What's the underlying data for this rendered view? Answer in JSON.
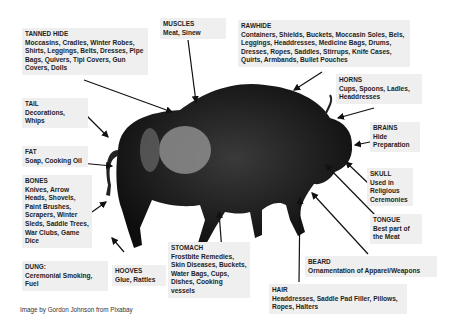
{
  "credit": "Image by Gordon Johnson from Pixabay",
  "colors": {
    "label_bg": "#efefef",
    "text": "#1e1e1e",
    "arrow": "#111111",
    "animal": "#1a1a1a"
  },
  "labels": [
    {
      "id": "tanned-hide",
      "title": "TANNED HIDE",
      "body": "Moccasins, Cradles, Winter Robes, Shirts, Leggings, Belts, Dresses, Pipe Bags, Quivers, Tipi Covers, Gun Covers, Dolls"
    },
    {
      "id": "muscles",
      "title": "MUSCLES",
      "body": "Meat, Sinew"
    },
    {
      "id": "rawhide",
      "title": "RAWHIDE",
      "body": "Containers, Shields, Buckets, Moccasin Soles, Bels, Leggings, Headdresses, Medicine Bags, Drums, Dresses, Ropes, Saddles, Stirrups, Knife Cases, Quirts, Armbands, Bullet Pouches"
    },
    {
      "id": "horns",
      "title": "HORNS",
      "body": "Cups, Spoons, Ladles, Headdresses"
    },
    {
      "id": "brains",
      "title": "BRAINS",
      "body": "Hide Preparation"
    },
    {
      "id": "skull",
      "title": "SKULL",
      "body": "Used in Religious Ceremonies"
    },
    {
      "id": "tongue",
      "title": "TONGUE",
      "body": "Best part of the Meat"
    },
    {
      "id": "beard",
      "title": "BEARD",
      "body": "Ornamentation of Apparel/Weapons"
    },
    {
      "id": "hair",
      "title": "HAIR",
      "body": "Headdresses, Saddle Pad Filler, Pillows, Ropes, Halters"
    },
    {
      "id": "stomach",
      "title": "STOMACH",
      "body": "Frostbite Remedies, Skin Diseases, Buckets, Water Bags, Cups, Dishes, Cooking vessels"
    },
    {
      "id": "hooves",
      "title": "HOOVES",
      "body": "Glue, Rattles"
    },
    {
      "id": "dung",
      "title": "DUNG:",
      "body": "Ceremonial Smoking, Fuel"
    },
    {
      "id": "bones",
      "title": "BONES",
      "body": "Knives, Arrow Heads, Shovels, Paint Brushes, Scrapers, Winter Sleds, Saddle Trees, War Clubs, Game Dice"
    },
    {
      "id": "fat",
      "title": "FAT",
      "body": "Soap, Cooking Oil"
    },
    {
      "id": "tail",
      "title": "TAIL",
      "body": "Decorations, Whips"
    }
  ]
}
